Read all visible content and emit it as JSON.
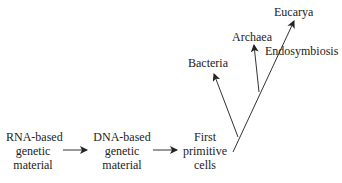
{
  "diagram": {
    "stages": [
      {
        "lines": [
          "RNA-based",
          "genetic",
          "material"
        ]
      },
      {
        "lines": [
          "DNA-based",
          "genetic",
          "material"
        ]
      },
      {
        "lines": [
          "First",
          "primitive",
          "cells"
        ]
      }
    ],
    "branches": {
      "bacteria": "Bacteria",
      "archaea": "Archaea",
      "eucarya": "Eucarya",
      "endosymbiosis": "Endosymbiosis"
    },
    "colors": {
      "line": "#333333",
      "text": "#222222"
    }
  }
}
